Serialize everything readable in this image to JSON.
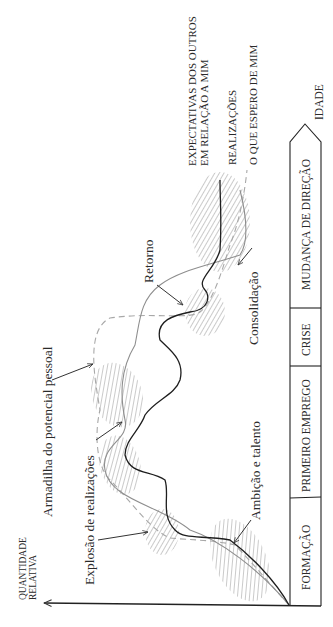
{
  "axes": {
    "y_label_line1": "QUANTIDADE",
    "y_label_line2": "RELATIVA",
    "x_label": "IDADE"
  },
  "stages": [
    {
      "label": "FORMAÇÃO"
    },
    {
      "label": "PRIMEIRO EMPREGO"
    },
    {
      "label": "CRISE"
    },
    {
      "label": "MUDANÇA DE DIREÇÃO"
    }
  ],
  "legend": {
    "expectations_line1": "EXPECTATIVAS DOS OUTROS",
    "expectations_line2": "EM RELAÇÃO A MIM",
    "achievements": "REALIZAÇÕES",
    "self_expectations": "O QUE ESPERO DE MIM"
  },
  "annotations": {
    "ambition": "Ambição e talento",
    "explosion": "Explosão de realizações",
    "trap": "Armadilha do potencial pessoal",
    "return": "Retorno",
    "consolidation": "Consolidação"
  },
  "colors": {
    "achievements_line": "#222222",
    "expectations_line": "#9a9a9a",
    "self_line_dashed": "#a8a8a8",
    "hatch": "#bdbdbd",
    "axis": "#222222"
  }
}
